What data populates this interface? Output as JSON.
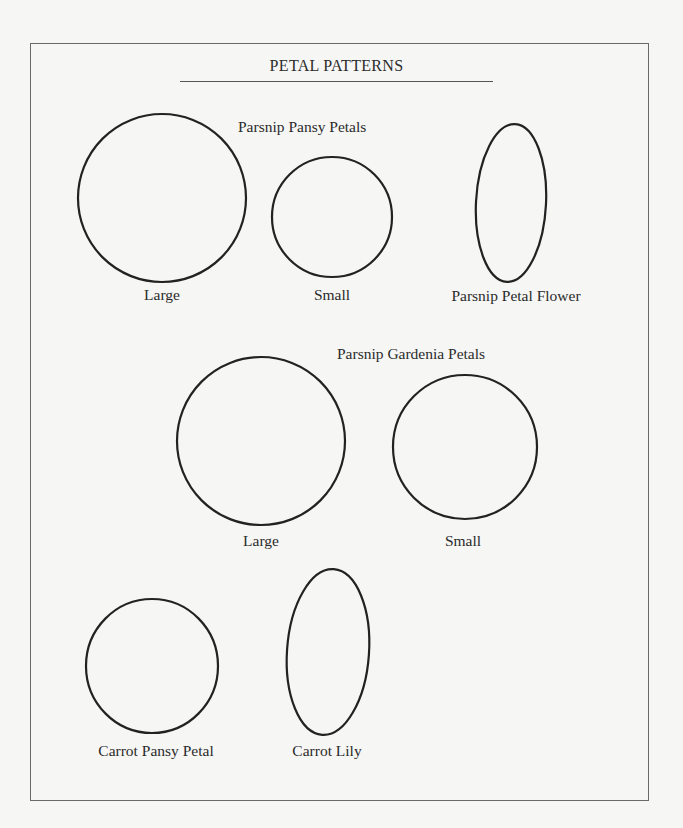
{
  "page": {
    "title": "PETAL PATTERNS"
  },
  "groups": {
    "parsnip_pansy": {
      "heading": "Parsnip Pansy Petals",
      "items": [
        {
          "label": "Large",
          "shape": "circle"
        },
        {
          "label": "Small",
          "shape": "circle"
        }
      ]
    },
    "parsnip_petal_flower": {
      "label": "Parsnip Petal Flower",
      "shape": "oval"
    },
    "parsnip_gardenia": {
      "heading": "Parsnip Gardenia Petals",
      "items": [
        {
          "label": "Large",
          "shape": "circle"
        },
        {
          "label": "Small",
          "shape": "circle"
        }
      ]
    },
    "carrot_pansy_petal": {
      "label": "Carrot Pansy Petal",
      "shape": "circle"
    },
    "carrot_lily": {
      "label": "Carrot Lily",
      "shape": "oval"
    }
  }
}
